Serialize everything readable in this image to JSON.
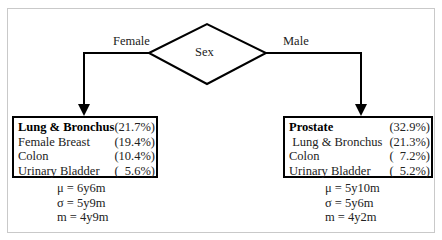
{
  "diagram": {
    "decision": {
      "label": "Sex"
    },
    "branches": [
      {
        "edge_label": "Female",
        "box": {
          "rows": [
            {
              "name": "Lung & Bronchus",
              "pct": "(21.7%)",
              "bold": true
            },
            {
              "name": "Female Breast",
              "pct": "(19.4%)"
            },
            {
              "name": "Colon",
              "pct": "(10.4%)"
            },
            {
              "name": "Urinary Bladder",
              "pct": "(  5.6%)"
            }
          ]
        },
        "stats": {
          "mu": "μ = 6y6m",
          "sigma": "σ = 5y9m",
          "m": "m = 4y9m"
        }
      },
      {
        "edge_label": "Male",
        "box": {
          "rows": [
            {
              "name": "Prostate",
              "pct": "(32.9%)",
              "bold": true
            },
            {
              "name": " Lung & Bronchus",
              "pct": "(21.3%)"
            },
            {
              "name": "Colon",
              "pct": "(  7.2%)"
            },
            {
              "name": "Urinary Bladder",
              "pct": "(  5.2%)"
            }
          ]
        },
        "stats": {
          "mu": "μ = 5y10m",
          "sigma": "σ = 5y6m",
          "m": "m = 4y2m"
        }
      }
    ]
  }
}
